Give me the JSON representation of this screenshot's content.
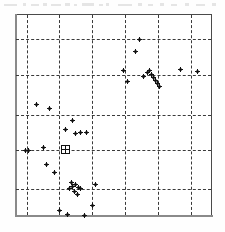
{
  "figure": {
    "title": "",
    "caption": "",
    "background_color": "#ffffff",
    "frame_color": "#4a4a4a",
    "grid_color": "#3a3a3a",
    "marker_color": "#111111"
  },
  "chart_data": {
    "type": "scatter",
    "title": "",
    "subtitle": "",
    "xlabel": "",
    "ylabel": "",
    "xlim": [
      0,
      100
    ],
    "ylim": [
      0,
      100
    ],
    "xticks": [],
    "yticks": [],
    "xticklabels": [],
    "yticklabels": [],
    "grid": true,
    "grid_style": "dashed",
    "grid_x": [
      5.6,
      22.3,
      39.1,
      55.8,
      72.6,
      89.8
    ],
    "grid_y": [
      12.9,
      32.7,
      50.0,
      69.8,
      88.1
    ],
    "legend": null,
    "legend_position": "none",
    "annotations": [],
    "series": [
      {
        "name": "observations",
        "marker": "plus-dot",
        "color": "#111111",
        "points": [
          [
            63.5,
            87.6
          ],
          [
            61.5,
            81.7
          ],
          [
            55.3,
            72.3
          ],
          [
            57.4,
            66.8
          ],
          [
            65.5,
            69.3
          ],
          [
            67.5,
            71.3
          ],
          [
            69.5,
            70.3
          ],
          [
            70.5,
            68.8
          ],
          [
            71.5,
            67.3
          ],
          [
            72.5,
            65.8
          ],
          [
            73.5,
            64.3
          ],
          [
            68.5,
            72.3
          ],
          [
            84.3,
            72.8
          ],
          [
            92.9,
            71.8
          ],
          [
            10.7,
            55.4
          ],
          [
            17.3,
            53.4
          ],
          [
            28.9,
            47.5
          ],
          [
            25.3,
            43.0
          ],
          [
            30.4,
            41.0
          ],
          [
            32.9,
            41.5
          ],
          [
            36.0,
            41.5
          ],
          [
            5.1,
            32.2
          ],
          [
            6.6,
            32.2
          ],
          [
            14.2,
            33.7
          ],
          [
            15.7,
            25.2
          ],
          [
            19.8,
            21.2
          ],
          [
            27.4,
            13.4
          ],
          [
            28.9,
            14.4
          ],
          [
            30.4,
            15.4
          ],
          [
            31.9,
            13.9
          ],
          [
            33.0,
            13.4
          ],
          [
            29.9,
            11.9
          ],
          [
            31.4,
            10.4
          ],
          [
            28.4,
            16.4
          ],
          [
            40.6,
            15.4
          ],
          [
            39.1,
            5.0
          ],
          [
            22.3,
            2.5
          ],
          [
            26.4,
            0.5
          ],
          [
            35.0,
            0.0
          ]
        ]
      },
      {
        "name": "highlighted-site",
        "marker": "boxed-cross",
        "color": "#111111",
        "points": [
          [
            25.4,
            32.7
          ]
        ]
      }
    ]
  }
}
